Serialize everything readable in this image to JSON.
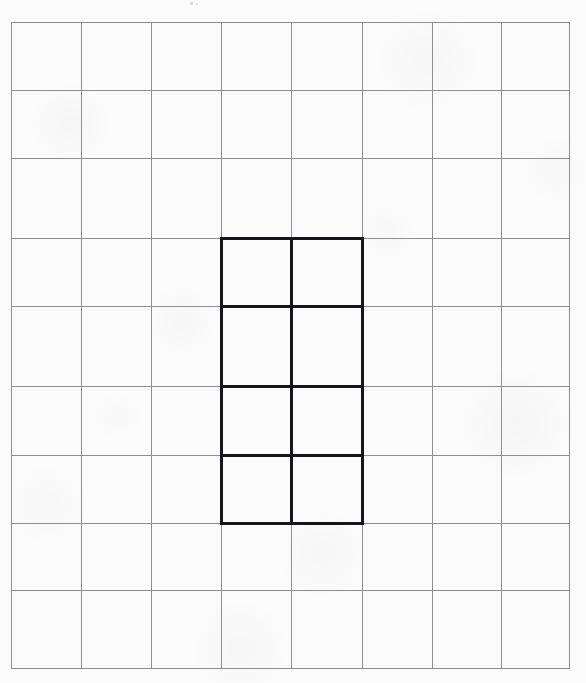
{
  "document": {
    "title": "Grid Worksheet",
    "type": "scanned-graph-paper",
    "width": 586,
    "height": 683,
    "background_color": "#fbfbfb"
  },
  "grid": {
    "name": "light-graph-grid",
    "line_color": "#8f8f91",
    "line_width": 1.4,
    "columns": 8,
    "rows": 9,
    "x_positions": [
      11,
      81,
      151,
      221,
      291,
      362,
      432,
      501,
      569
    ],
    "y_positions": [
      22,
      90,
      158,
      238,
      306,
      386,
      455,
      523,
      590,
      668
    ],
    "cell_width": 70,
    "cell_height": 70,
    "bounds": {
      "left": 11,
      "top": 22,
      "right": 569,
      "bottom": 668
    }
  },
  "shape": {
    "name": "highlighted-rectangle",
    "description": "Bold 2-column by 4-row rectangle drawn over the grid",
    "line_color": "#16161a",
    "line_width": 3,
    "columns": 2,
    "rows": 4,
    "cell_count": 8,
    "x_positions": [
      221,
      291,
      362
    ],
    "y_positions": [
      238,
      306,
      386,
      455,
      523
    ],
    "bounds": {
      "left": 221,
      "top": 238,
      "right": 362,
      "bottom": 523
    },
    "grid_span": {
      "col_start": 4,
      "col_end": 5,
      "row_start": 4,
      "row_end": 7
    }
  },
  "artifacts": [
    {
      "name": "scan-speck",
      "x": 190,
      "y": 2,
      "width": 3,
      "height": 3
    },
    {
      "name": "scan-speck",
      "x": 196,
      "y": 3,
      "width": 2,
      "height": 2
    }
  ]
}
